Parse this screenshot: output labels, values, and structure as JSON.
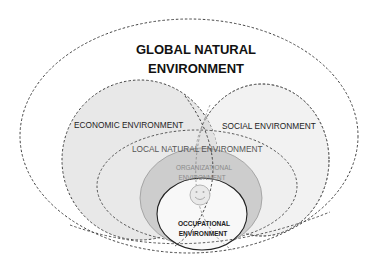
{
  "diagram": {
    "title_line1": "GLOBAL NATURAL",
    "title_line2": "ENVIRONMENT",
    "labels": {
      "economic": "ECONOMIC ENVIRONMENT",
      "social": "SOCIAL ENVIRONMENT",
      "local": "LOCAL NATURAL ENVIRONMENT",
      "organizational_line1": "ORGANIZATIONAL",
      "organizational_line2": "ENVIRONMENT",
      "occupational_line1": "OCCUPATIONAL",
      "occupational_line2": "ENVIRONMENT"
    },
    "center_icon": "smiley-face-icon",
    "colors": {
      "background": "#ffffff",
      "economic_fill": "#e6e6e6",
      "social_fill": "#f1f1f1",
      "local_fill": "#ebebeb",
      "organizational_fill": "#c9c9c9",
      "occupational_fill": "#f7f7f7",
      "dash_stroke": "#333333"
    }
  }
}
